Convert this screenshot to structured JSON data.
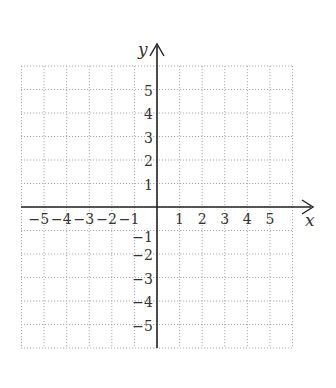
{
  "chart_data": {
    "type": "coordinate-grid",
    "title": "",
    "xlabel": "x",
    "ylabel": "y",
    "xlim": [
      -6,
      6
    ],
    "ylim": [
      -6,
      6
    ],
    "grid": true,
    "grid_style": "dotted",
    "x_tick_labels": [
      "−5",
      "−4",
      "−3",
      "−2",
      "−1",
      "1",
      "2",
      "3",
      "4",
      "5"
    ],
    "y_tick_labels": [
      "5",
      "4",
      "3",
      "2",
      "1",
      "−1",
      "−2",
      "−3",
      "−4",
      "−5"
    ],
    "x_ticks": [
      -5,
      -4,
      -3,
      -2,
      -1,
      1,
      2,
      3,
      4,
      5
    ],
    "y_ticks": [
      5,
      4,
      3,
      2,
      1,
      -1,
      -2,
      -3,
      -4,
      -5
    ],
    "series": []
  },
  "colors": {
    "axis": "#222222",
    "grid": "#aaaaaa",
    "text": "#333333"
  }
}
